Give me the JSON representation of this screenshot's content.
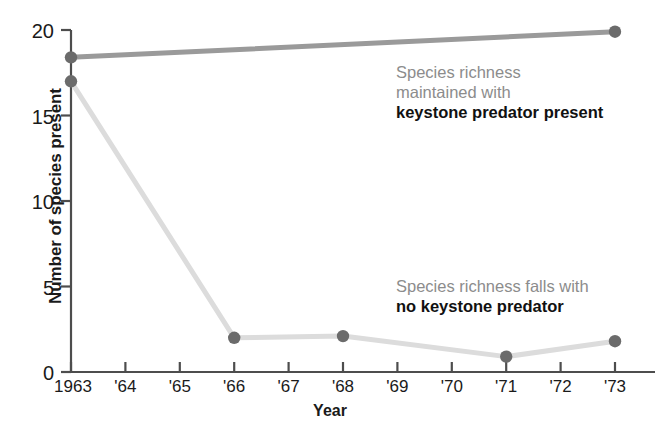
{
  "chart_data": {
    "type": "line",
    "title": "",
    "xlabel": "Year",
    "ylabel": "Number of species present",
    "x": [
      1963,
      1964,
      1965,
      1966,
      1967,
      1968,
      1969,
      1970,
      1971,
      1972,
      1973
    ],
    "xtick_labels": [
      "1963",
      "'64",
      "'65",
      "'66",
      "'67",
      "'68",
      "'69",
      "'70",
      "'71",
      "'72",
      "'73"
    ],
    "ytick_labels": [
      "0",
      "5",
      "10",
      "15",
      "20"
    ],
    "yticks": [
      0,
      5,
      10,
      15,
      20
    ],
    "ylim": [
      0,
      20
    ],
    "xlim": [
      1963,
      1973
    ],
    "grid": false,
    "legend_position": "inline-annotations",
    "series": [
      {
        "name": "keystone predator present",
        "color": "#9a9a9a",
        "marker_color": "#6b6b6b",
        "points": [
          {
            "x": 1963,
            "y": 18.4
          },
          {
            "x": 1973,
            "y": 19.9
          }
        ]
      },
      {
        "name": "no keystone predator",
        "color": "#dcdcdc",
        "marker_color": "#6b6b6b",
        "points": [
          {
            "x": 1963,
            "y": 17.0
          },
          {
            "x": 1966,
            "y": 2.0
          },
          {
            "x": 1968,
            "y": 2.1
          },
          {
            "x": 1971,
            "y": 0.9
          },
          {
            "x": 1973,
            "y": 1.8
          }
        ]
      }
    ],
    "annotations": [
      {
        "id": "top",
        "lines": [
          "Species richness",
          "maintained with"
        ],
        "emphasis": "keystone predator present",
        "soft_color": "#8c8c8c",
        "strong_color": "#111111"
      },
      {
        "id": "bottom",
        "lines": [
          "Species richness falls with"
        ],
        "emphasis": "no keystone predator",
        "soft_color": "#8c8c8c",
        "strong_color": "#111111"
      }
    ],
    "axis_color": "#4d4d4d"
  }
}
